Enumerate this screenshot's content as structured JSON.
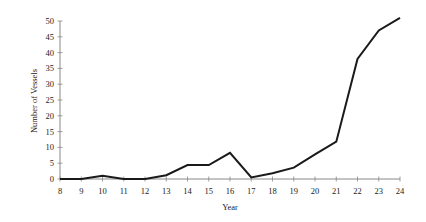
{
  "chart_data": {
    "type": "line",
    "title": "",
    "xlabel": "Year",
    "ylabel": "Number of Vessels",
    "x": [
      8,
      9,
      10,
      11,
      12,
      13,
      14,
      15,
      16,
      17,
      18,
      19,
      20,
      21,
      22,
      23,
      24
    ],
    "series": [
      {
        "name": "Number of Vessels",
        "values": [
          0,
          0,
          1,
          0,
          0,
          1.2,
          4.4,
          4.4,
          8.3,
          0.5,
          1.8,
          3.6,
          7.8,
          11.8,
          38,
          47,
          51
        ]
      }
    ],
    "xlim": [
      8,
      24
    ],
    "ylim": [
      0,
      50
    ],
    "x_ticks": [
      "8",
      "9",
      "10",
      "11",
      "12",
      "13",
      "14",
      "15",
      "16",
      "17",
      "18",
      "19",
      "20",
      "21",
      "22",
      "23",
      "24"
    ],
    "y_ticks": [
      "0",
      "5",
      "10",
      "15",
      "20",
      "25",
      "30",
      "35",
      "40",
      "45",
      "50"
    ],
    "grid": false,
    "legend": null,
    "line_color": "#1a1a1a",
    "axis_color": "#888888"
  }
}
